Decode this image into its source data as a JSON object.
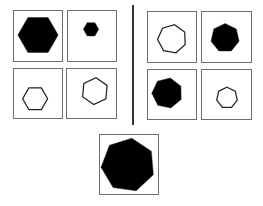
{
  "puzzle": {
    "left_group": [
      {
        "id": "L1",
        "shape": "hexagon",
        "sides": 6,
        "fill": "black",
        "size": "large",
        "box": [
          13,
          10,
          50,
          52
        ],
        "cx": 25,
        "cy": 25,
        "r": 21,
        "rot": 0
      },
      {
        "id": "L2",
        "shape": "hexagon",
        "sides": 6,
        "fill": "black",
        "size": "small",
        "box": [
          67,
          10,
          50,
          52
        ],
        "cx": 24,
        "cy": 19,
        "r": 8,
        "rot": 30
      },
      {
        "id": "L3",
        "shape": "hexagon",
        "sides": 6,
        "fill": "outline",
        "size": "medium",
        "box": [
          13,
          68,
          50,
          51
        ],
        "cx": 22,
        "cy": 31,
        "r": 13,
        "rot": 0
      },
      {
        "id": "L4",
        "shape": "hexagon",
        "sides": 6,
        "fill": "outline",
        "size": "medium",
        "box": [
          66,
          68,
          51,
          51
        ],
        "cx": 29,
        "cy": 23,
        "r": 14,
        "rot": 5
      }
    ],
    "right_group": [
      {
        "id": "R1",
        "shape": "heptagon",
        "sides": 7,
        "fill": "outline",
        "size": "medium",
        "box": [
          147,
          11,
          50,
          52
        ],
        "cx": 25,
        "cy": 28,
        "r": 15,
        "rot": 10
      },
      {
        "id": "R2",
        "shape": "heptagon",
        "sides": 7,
        "fill": "black",
        "size": "medium",
        "box": [
          201,
          11,
          51,
          52
        ],
        "cx": 24,
        "cy": 27,
        "r": 15,
        "rot": 0
      },
      {
        "id": "R3",
        "shape": "heptagon",
        "sides": 7,
        "fill": "black",
        "size": "medium",
        "box": [
          147,
          69,
          50,
          51
        ],
        "cx": 20,
        "cy": 24,
        "r": 16,
        "rot": 12
      },
      {
        "id": "R4",
        "shape": "heptagon",
        "sides": 7,
        "fill": "outline",
        "size": "small",
        "box": [
          201,
          69,
          51,
          51
        ],
        "cx": 26,
        "cy": 29,
        "r": 11,
        "rot": 0
      }
    ],
    "answer_candidate": {
      "id": "Q",
      "shape": "heptagon",
      "sides": 7,
      "fill": "black",
      "size": "extra-large",
      "box": [
        99,
        134,
        60,
        61
      ],
      "cx": 29,
      "cy": 31,
      "r": 28,
      "rot": 8
    },
    "colors": {
      "fill": "#000000",
      "stroke": "#222222",
      "border": "#6e6e6e",
      "divider": "#333333"
    }
  }
}
